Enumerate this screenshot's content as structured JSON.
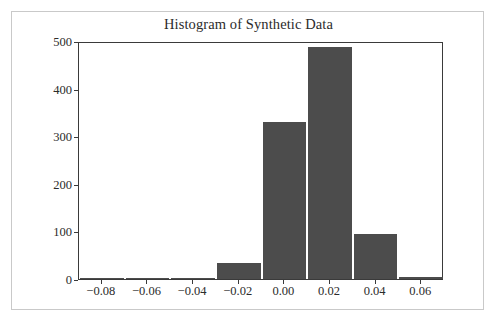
{
  "chart_data": {
    "type": "bar",
    "title": "Histogram of Synthetic Data",
    "xlabel": "",
    "ylabel": "",
    "grid": false,
    "legend": null,
    "xlim": [
      -0.09,
      0.07
    ],
    "ylim": [
      0,
      500
    ],
    "bin_width": 0.02,
    "xticks": [
      -0.08,
      -0.06,
      -0.04,
      -0.02,
      0.0,
      0.02,
      0.04,
      0.06
    ],
    "xtick_labels": [
      "−0.08",
      "−0.06",
      "−0.04",
      "−0.02",
      "0.00",
      "0.02",
      "0.04",
      "0.06"
    ],
    "yticks": [
      0,
      100,
      200,
      300,
      400,
      500
    ],
    "ytick_labels": [
      "0",
      "100",
      "200",
      "300",
      "400",
      "500"
    ],
    "bar_color": "#4c4c4c",
    "bin_edges": [
      -0.09,
      -0.07,
      -0.05,
      -0.03,
      -0.01,
      0.01,
      0.03,
      0.05
    ],
    "bins": [
      {
        "left": -0.09,
        "right": -0.07,
        "center": -0.08,
        "value": 1
      },
      {
        "left": -0.07,
        "right": -0.05,
        "center": -0.06,
        "value": 3
      },
      {
        "left": -0.05,
        "right": -0.03,
        "center": -0.04,
        "value": 3
      },
      {
        "left": -0.03,
        "right": -0.01,
        "center": -0.02,
        "value": 33
      },
      {
        "left": -0.01,
        "right": 0.01,
        "center": 0.0,
        "value": 330
      },
      {
        "left": 0.01,
        "right": 0.03,
        "center": 0.02,
        "value": 488
      },
      {
        "left": 0.03,
        "right": 0.05,
        "center": 0.04,
        "value": 95
      },
      {
        "left": 0.05,
        "right": 0.07,
        "center": 0.06,
        "value": 5
      }
    ],
    "categories": [
      "-0.08",
      "-0.06",
      "-0.04",
      "-0.02",
      "0.00",
      "0.02",
      "0.04",
      "0.06"
    ],
    "values": [
      1,
      3,
      3,
      33,
      330,
      488,
      95,
      5
    ]
  }
}
